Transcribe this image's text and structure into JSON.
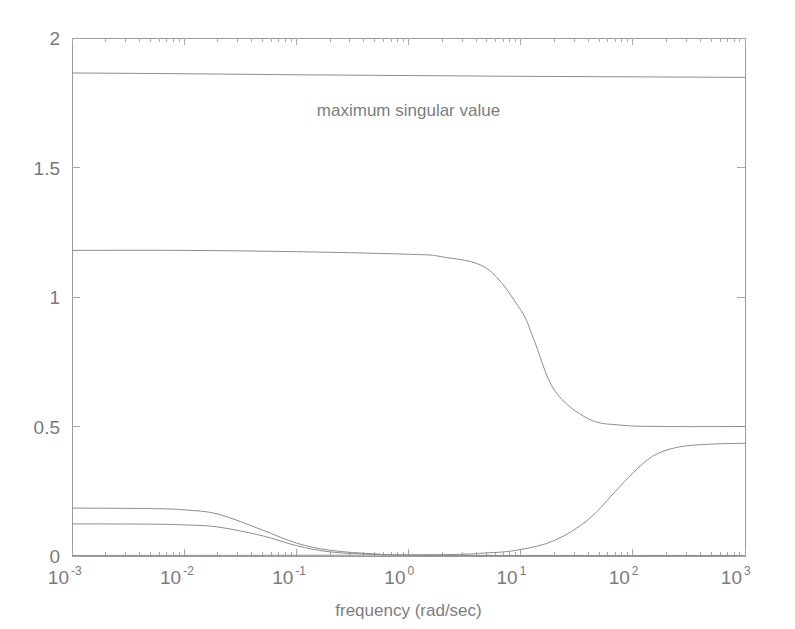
{
  "chart_data": {
    "type": "line",
    "title": "",
    "xlabel": "frequency (rad/sec)",
    "ylabel": "",
    "xscale": "log",
    "yscale": "linear",
    "xlim": [
      0.001,
      1000
    ],
    "ylim": [
      0,
      2
    ],
    "grid": false,
    "legend_position": "none",
    "xticks": [
      0.001,
      0.01,
      0.1,
      1,
      10,
      100,
      1000
    ],
    "xtick_labels": [
      "10^-3",
      "10^-2",
      "10^-1",
      "10^0",
      "10^1",
      "10^2",
      "10^3"
    ],
    "xtick_mantissa": [
      "10",
      "10",
      "10",
      "10",
      "10",
      "10",
      "10"
    ],
    "xtick_exponents": [
      "-3",
      "-2",
      "-1",
      "0",
      "1",
      "2",
      "3"
    ],
    "yticks": [
      0,
      0.5,
      1,
      1.5,
      2
    ],
    "ytick_labels": [
      "0",
      "0.5",
      "1",
      "1.5",
      "2"
    ],
    "annotations": [
      {
        "text": "maximum singular value",
        "x": 1.0,
        "y": 1.7,
        "name": "maximum-singular-value-label"
      }
    ],
    "line_color": "#8d8d8d",
    "axis_color": "#9a9a9a",
    "text_color": "#7a7a7a",
    "background_color": "#ffffff",
    "series": [
      {
        "name": "maximum singular value",
        "description": "nearly constant upper bound",
        "x": [
          0.001,
          0.01,
          0.1,
          1,
          10,
          100,
          1000
        ],
        "values": [
          1.865,
          1.862,
          1.858,
          1.855,
          1.852,
          1.85,
          1.848
        ]
      },
      {
        "name": "singular value 2",
        "description": "high-frequency rolloff from 1.18 to 0.5",
        "x": [
          0.001,
          0.01,
          0.1,
          1,
          2,
          5,
          10,
          13,
          20,
          40,
          80,
          200,
          1000
        ],
        "values": [
          1.18,
          1.18,
          1.175,
          1.165,
          1.155,
          1.11,
          0.95,
          0.84,
          0.64,
          0.53,
          0.505,
          0.5,
          0.5
        ]
      },
      {
        "name": "singular value 3",
        "description": "low-frequency rolloff from 0.185 to 0",
        "x": [
          0.001,
          0.005,
          0.01,
          0.02,
          0.05,
          0.1,
          0.2,
          0.5,
          1,
          10,
          100,
          1000
        ],
        "values": [
          0.185,
          0.183,
          0.178,
          0.162,
          0.1,
          0.05,
          0.022,
          0.008,
          0.004,
          0.002,
          0.002,
          0.002
        ]
      },
      {
        "name": "singular value 4",
        "description": "low-frequency rolloff from 0.124 to 0",
        "x": [
          0.001,
          0.005,
          0.01,
          0.02,
          0.05,
          0.1,
          0.2,
          0.5,
          1,
          10,
          100,
          1000
        ],
        "values": [
          0.124,
          0.123,
          0.12,
          0.112,
          0.078,
          0.04,
          0.016,
          0.006,
          0.003,
          0.002,
          0.002,
          0.002
        ]
      },
      {
        "name": "singular value 5",
        "description": "high-frequency rise from 0 to 0.435",
        "x": [
          0.001,
          1,
          5,
          10,
          20,
          40,
          70,
          100,
          150,
          250,
          500,
          1000
        ],
        "values": [
          0.002,
          0.004,
          0.012,
          0.025,
          0.06,
          0.14,
          0.25,
          0.32,
          0.385,
          0.42,
          0.432,
          0.435
        ]
      }
    ]
  }
}
